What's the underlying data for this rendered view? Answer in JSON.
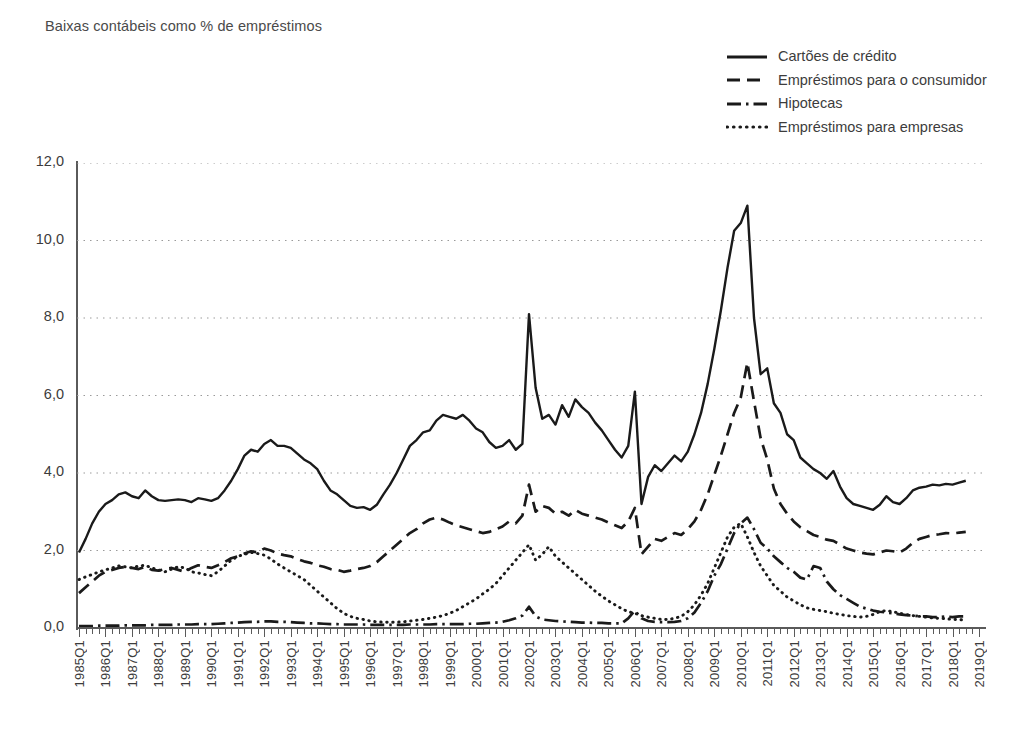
{
  "chart_title": "Baixas contábeis como % de empréstimos",
  "caption": "",
  "legend": {
    "items": [
      {
        "label": "Cartões de crédito",
        "style": "solid",
        "icon": "solid-line-icon"
      },
      {
        "label": "Empréstimos para o consumidor",
        "style": "dashed",
        "icon": "dashed-line-icon"
      },
      {
        "label": "Hipotecas",
        "style": "dashdot",
        "icon": "dash-dot-line-icon"
      },
      {
        "label": "Empréstimos para empresas",
        "style": "dotted",
        "icon": "dotted-line-icon"
      }
    ]
  },
  "axis": {
    "y_ticks": [
      "12,0",
      "10,0",
      "8,0",
      "6,0",
      "4,0",
      "2,0",
      "0,0"
    ],
    "y_values": [
      12,
      10,
      8,
      6,
      4,
      2,
      0
    ]
  },
  "chart_data": {
    "type": "line",
    "title": "Baixas contábeis como % de empréstimos",
    "xlabel": "",
    "ylabel": "",
    "ylim": [
      0,
      12
    ],
    "ytick_step": 2,
    "grid": "horizontal-dotted",
    "legend_position": "top-right",
    "line_color": "#1a1a1a",
    "x_tick_labels": [
      "1985Q1",
      "1986Q1",
      "1987Q1",
      "1988Q1",
      "1989Q1",
      "1990Q1",
      "1991Q1",
      "1992Q1",
      "1993Q1",
      "1994Q1",
      "1995Q1",
      "1996Q1",
      "1997Q1",
      "1998Q1",
      "1999Q1",
      "2000Q1",
      "2001Q1",
      "2002Q1",
      "2003Q1",
      "2004Q1",
      "2005Q1",
      "2006Q1",
      "2007Q1",
      "2008Q1",
      "2009Q1",
      "2010Q1",
      "2011Q1",
      "2012Q1",
      "2013Q1",
      "2014Q1",
      "2015Q1",
      "2016Q1",
      "2017Q1",
      "2018Q1",
      "2019Q1"
    ],
    "x_quarters": [
      "1985Q1",
      "1985Q2",
      "1985Q3",
      "1985Q4",
      "1986Q1",
      "1986Q2",
      "1986Q3",
      "1986Q4",
      "1987Q1",
      "1987Q2",
      "1987Q3",
      "1987Q4",
      "1988Q1",
      "1988Q2",
      "1988Q3",
      "1988Q4",
      "1989Q1",
      "1989Q2",
      "1989Q3",
      "1989Q4",
      "1990Q1",
      "1990Q2",
      "1990Q3",
      "1990Q4",
      "1991Q1",
      "1991Q2",
      "1991Q3",
      "1991Q4",
      "1992Q1",
      "1992Q2",
      "1992Q3",
      "1992Q4",
      "1993Q1",
      "1993Q2",
      "1993Q3",
      "1993Q4",
      "1994Q1",
      "1994Q2",
      "1994Q3",
      "1994Q4",
      "1995Q1",
      "1995Q2",
      "1995Q3",
      "1995Q4",
      "1996Q1",
      "1996Q2",
      "1996Q3",
      "1996Q4",
      "1997Q1",
      "1997Q2",
      "1997Q3",
      "1997Q4",
      "1998Q1",
      "1998Q2",
      "1998Q3",
      "1998Q4",
      "1999Q1",
      "1999Q2",
      "1999Q3",
      "1999Q4",
      "2000Q1",
      "2000Q2",
      "2000Q3",
      "2000Q4",
      "2001Q1",
      "2001Q2",
      "2001Q3",
      "2001Q4",
      "2002Q1",
      "2002Q2",
      "2002Q3",
      "2002Q4",
      "2003Q1",
      "2003Q2",
      "2003Q3",
      "2003Q4",
      "2004Q1",
      "2004Q2",
      "2004Q3",
      "2004Q4",
      "2005Q1",
      "2005Q2",
      "2005Q3",
      "2005Q4",
      "2006Q1",
      "2006Q2",
      "2006Q3",
      "2006Q4",
      "2007Q1",
      "2007Q2",
      "2007Q3",
      "2007Q4",
      "2008Q1",
      "2008Q2",
      "2008Q3",
      "2008Q4",
      "2009Q1",
      "2009Q2",
      "2009Q3",
      "2009Q4",
      "2010Q1",
      "2010Q2",
      "2010Q3",
      "2010Q4",
      "2011Q1",
      "2011Q2",
      "2011Q3",
      "2011Q4",
      "2012Q1",
      "2012Q2",
      "2012Q3",
      "2012Q4",
      "2013Q1",
      "2013Q2",
      "2013Q3",
      "2013Q4",
      "2014Q1",
      "2014Q2",
      "2014Q3",
      "2014Q4",
      "2015Q1",
      "2015Q2",
      "2015Q3",
      "2015Q4",
      "2016Q1",
      "2016Q2",
      "2016Q3",
      "2016Q4",
      "2017Q1",
      "2017Q2",
      "2017Q3",
      "2017Q4",
      "2018Q1",
      "2018Q2",
      "2018Q3",
      "2018Q4",
      "2019Q1"
    ],
    "series": [
      {
        "name": "Cartões de crédito",
        "style": "solid",
        "values": [
          1.95,
          2.3,
          2.7,
          3.0,
          3.2,
          3.3,
          3.45,
          3.5,
          3.4,
          3.35,
          3.55,
          3.4,
          3.3,
          3.28,
          3.3,
          3.32,
          3.3,
          3.25,
          3.35,
          3.32,
          3.28,
          3.35,
          3.55,
          3.8,
          4.1,
          4.45,
          4.6,
          4.55,
          4.75,
          4.85,
          4.7,
          4.7,
          4.65,
          4.5,
          4.35,
          4.25,
          4.1,
          3.8,
          3.55,
          3.45,
          3.3,
          3.15,
          3.1,
          3.12,
          3.05,
          3.18,
          3.45,
          3.7,
          4.0,
          4.35,
          4.7,
          4.85,
          5.05,
          5.1,
          5.35,
          5.5,
          5.45,
          5.4,
          5.5,
          5.35,
          5.15,
          5.05,
          4.8,
          4.65,
          4.7,
          4.85,
          4.6,
          4.75,
          8.1,
          6.2,
          5.4,
          5.5,
          5.25,
          5.75,
          5.45,
          5.9,
          5.7,
          5.55,
          5.3,
          5.1,
          4.85,
          4.6,
          4.4,
          4.7,
          6.1,
          3.2,
          3.9,
          4.2,
          4.05,
          4.25,
          4.45,
          4.3,
          4.55,
          5.0,
          5.55,
          6.3,
          7.2,
          8.2,
          9.3,
          10.25,
          10.45,
          10.9,
          8.0,
          6.55,
          6.7,
          5.8,
          5.55,
          5.0,
          4.85,
          4.4,
          4.25,
          4.1,
          4.0,
          3.85,
          4.05,
          3.65,
          3.35,
          3.2,
          3.15,
          3.1,
          3.05,
          3.18,
          3.4,
          3.25,
          3.2,
          3.35,
          3.55,
          3.62,
          3.65,
          3.7,
          3.68,
          3.72,
          3.7,
          3.75,
          3.8
        ]
      },
      {
        "name": "Empréstimos para o consumidor",
        "style": "dashed",
        "values": [
          0.9,
          1.05,
          1.2,
          1.35,
          1.45,
          1.5,
          1.55,
          1.58,
          1.55,
          1.52,
          1.58,
          1.5,
          1.48,
          1.52,
          1.55,
          1.5,
          1.45,
          1.55,
          1.62,
          1.58,
          1.55,
          1.62,
          1.7,
          1.8,
          1.85,
          1.92,
          1.98,
          1.95,
          2.05,
          2.0,
          1.92,
          1.88,
          1.85,
          1.78,
          1.72,
          1.68,
          1.62,
          1.58,
          1.52,
          1.5,
          1.45,
          1.48,
          1.52,
          1.55,
          1.6,
          1.7,
          1.85,
          2.0,
          2.15,
          2.3,
          2.45,
          2.55,
          2.7,
          2.8,
          2.85,
          2.8,
          2.72,
          2.65,
          2.6,
          2.55,
          2.5,
          2.45,
          2.48,
          2.55,
          2.62,
          2.75,
          2.7,
          2.9,
          3.7,
          3.0,
          3.15,
          3.1,
          2.95,
          3.0,
          2.9,
          3.05,
          2.95,
          2.9,
          2.85,
          2.8,
          2.72,
          2.65,
          2.58,
          2.75,
          3.1,
          1.9,
          2.1,
          2.3,
          2.25,
          2.35,
          2.45,
          2.4,
          2.55,
          2.75,
          3.05,
          3.45,
          3.95,
          4.45,
          5.0,
          5.55,
          5.95,
          6.85,
          5.85,
          4.9,
          4.35,
          3.6,
          3.2,
          2.95,
          2.75,
          2.6,
          2.5,
          2.4,
          2.35,
          2.28,
          2.25,
          2.15,
          2.05,
          2.0,
          1.95,
          1.92,
          1.9,
          1.95,
          2.0,
          1.98,
          1.95,
          2.05,
          2.2,
          2.3,
          2.35,
          2.4,
          2.42,
          2.45,
          2.44,
          2.46,
          2.48
        ]
      },
      {
        "name": "Hipotecas",
        "style": "dashdot",
        "values": [
          0.05,
          0.05,
          0.05,
          0.06,
          0.06,
          0.06,
          0.06,
          0.07,
          0.07,
          0.07,
          0.07,
          0.08,
          0.08,
          0.08,
          0.08,
          0.09,
          0.09,
          0.09,
          0.1,
          0.1,
          0.1,
          0.11,
          0.12,
          0.13,
          0.14,
          0.15,
          0.16,
          0.16,
          0.17,
          0.17,
          0.16,
          0.16,
          0.15,
          0.14,
          0.13,
          0.12,
          0.12,
          0.11,
          0.1,
          0.1,
          0.09,
          0.09,
          0.09,
          0.09,
          0.08,
          0.08,
          0.08,
          0.08,
          0.08,
          0.08,
          0.09,
          0.09,
          0.09,
          0.09,
          0.1,
          0.1,
          0.1,
          0.1,
          0.1,
          0.11,
          0.11,
          0.12,
          0.13,
          0.14,
          0.16,
          0.2,
          0.25,
          0.32,
          0.55,
          0.3,
          0.22,
          0.2,
          0.18,
          0.17,
          0.16,
          0.15,
          0.14,
          0.14,
          0.13,
          0.13,
          0.12,
          0.12,
          0.12,
          0.25,
          0.45,
          0.25,
          0.18,
          0.16,
          0.15,
          0.15,
          0.16,
          0.18,
          0.25,
          0.4,
          0.65,
          0.95,
          1.35,
          1.65,
          2.05,
          2.45,
          2.7,
          2.85,
          2.55,
          2.2,
          2.05,
          1.85,
          1.7,
          1.55,
          1.45,
          1.3,
          1.25,
          1.6,
          1.55,
          1.2,
          1.0,
          0.85,
          0.75,
          0.65,
          0.55,
          0.5,
          0.45,
          0.42,
          0.4,
          0.38,
          0.35,
          0.33,
          0.32,
          0.3,
          0.3,
          0.28,
          0.28,
          0.3,
          0.28,
          0.3,
          0.3
        ]
      },
      {
        "name": "Empréstimos para empresas",
        "style": "dotted",
        "values": [
          1.25,
          1.32,
          1.38,
          1.45,
          1.5,
          1.55,
          1.6,
          1.58,
          1.55,
          1.6,
          1.62,
          1.55,
          1.5,
          1.45,
          1.52,
          1.58,
          1.55,
          1.45,
          1.42,
          1.38,
          1.35,
          1.45,
          1.6,
          1.75,
          1.85,
          1.9,
          1.95,
          1.92,
          1.88,
          1.78,
          1.65,
          1.55,
          1.45,
          1.35,
          1.25,
          1.1,
          0.95,
          0.8,
          0.65,
          0.5,
          0.38,
          0.3,
          0.25,
          0.22,
          0.18,
          0.16,
          0.15,
          0.15,
          0.15,
          0.16,
          0.18,
          0.2,
          0.22,
          0.25,
          0.28,
          0.32,
          0.38,
          0.45,
          0.55,
          0.65,
          0.75,
          0.88,
          1.0,
          1.15,
          1.35,
          1.55,
          1.75,
          1.95,
          2.15,
          1.75,
          1.9,
          2.1,
          1.85,
          1.7,
          1.55,
          1.4,
          1.25,
          1.1,
          0.95,
          0.82,
          0.7,
          0.6,
          0.5,
          0.42,
          0.38,
          0.32,
          0.28,
          0.25,
          0.22,
          0.22,
          0.25,
          0.3,
          0.42,
          0.6,
          0.85,
          1.15,
          1.55,
          1.95,
          2.35,
          2.6,
          2.7,
          2.35,
          1.95,
          1.6,
          1.35,
          1.1,
          0.95,
          0.8,
          0.7,
          0.6,
          0.52,
          0.48,
          0.45,
          0.42,
          0.38,
          0.35,
          0.32,
          0.3,
          0.28,
          0.3,
          0.35,
          0.42,
          0.45,
          0.42,
          0.38,
          0.35,
          0.32,
          0.3,
          0.28,
          0.26,
          0.25,
          0.24,
          0.22,
          0.22,
          0.2
        ]
      }
    ]
  }
}
